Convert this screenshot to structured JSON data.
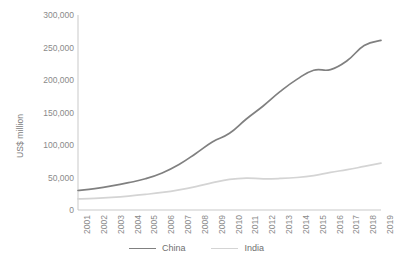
{
  "chart_data": {
    "type": "line",
    "title": "",
    "subtitle": "",
    "xlabel": "",
    "ylabel": "US$ million",
    "xlim": [
      2001,
      2019
    ],
    "ylim": [
      0,
      300000
    ],
    "grid": false,
    "legend_position": "bottom",
    "y_ticks": [
      0,
      50000,
      100000,
      150000,
      200000,
      250000,
      300000
    ],
    "y_tick_labels": [
      "0",
      "50,000",
      "100,000",
      "150,000",
      "200,000",
      "250,000",
      "300,000"
    ],
    "categories": [
      "2001",
      "2002",
      "2003",
      "2004",
      "2005",
      "2006",
      "2007",
      "2008",
      "2009",
      "2010",
      "2011",
      "2012",
      "2013",
      "2014",
      "2015",
      "2016",
      "2017",
      "2018",
      "2019"
    ],
    "series": [
      {
        "name": "China",
        "color": "#808080",
        "values": [
          30000,
          33000,
          37000,
          42000,
          48000,
          57000,
          70000,
          87000,
          105000,
          118000,
          140000,
          160000,
          182000,
          201000,
          215000,
          216000,
          230000,
          253000,
          261000
        ]
      },
      {
        "name": "India",
        "color": "#d4d4d4",
        "values": [
          17000,
          18000,
          19500,
          21500,
          24000,
          27000,
          31000,
          36000,
          42000,
          47000,
          49000,
          48000,
          48500,
          50000,
          53000,
          58000,
          62000,
          67000,
          72000
        ]
      }
    ]
  },
  "legend": {
    "entries": [
      {
        "label": "China",
        "color": "#808080"
      },
      {
        "label": "India",
        "color": "#d4d4d4"
      }
    ]
  },
  "footer": {
    "sliver_text": ""
  }
}
